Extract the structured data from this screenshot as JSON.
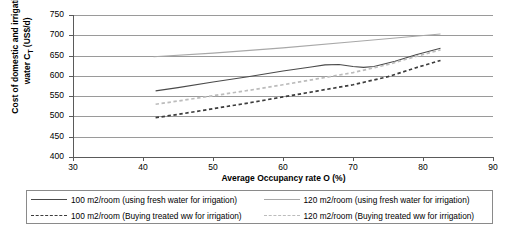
{
  "chart_data": {
    "type": "line",
    "title": "",
    "xlabel": "Average Occupancy rate O (%)",
    "ylabel_line1": "Cost of domestic and irrigation",
    "ylabel_line2": "water C",
    "ylabel_sub": "T",
    "ylabel_line2b": " (US$/d)",
    "xlim": [
      30,
      90
    ],
    "ylim": [
      400,
      750
    ],
    "xticks": [
      "30",
      "40",
      "50",
      "60",
      "70",
      "80",
      "90"
    ],
    "yticks": [
      "400",
      "450",
      "500",
      "550",
      "600",
      "650",
      "700",
      "750"
    ],
    "grid": true,
    "legend_position": "bottom",
    "series": [
      {
        "name": "100 m2/room (using fresh water for irrigation)",
        "style": "solid",
        "color": "#4a4a4a",
        "x": [
          41.8,
          45,
          50,
          55,
          60,
          64,
          66,
          68,
          70,
          71.5,
          73,
          76,
          79,
          82.5
        ],
        "y": [
          563,
          571,
          585,
          598,
          612,
          622,
          627,
          628,
          623,
          621,
          623,
          636,
          652,
          668
        ]
      },
      {
        "name": "120 m2/room (using fresh water for irrigation)",
        "style": "solid",
        "color": "#a8a8a8",
        "x": [
          41.5,
          50,
          60,
          70,
          82.5
        ],
        "y": [
          647,
          656,
          669,
          684,
          703
        ]
      },
      {
        "name": "100 m2/room (Buying treated ww for irrigation)",
        "style": "dashed",
        "color": "#3c3c3c",
        "x": [
          41.8,
          45,
          50,
          55,
          60,
          65,
          70,
          75,
          79,
          82.5
        ],
        "y": [
          497,
          505,
          519,
          533,
          548,
          563,
          578,
          598,
          620,
          638
        ]
      },
      {
        "name": "120 m2/room (Buying treated ww for irrigation)",
        "style": "dashed",
        "color": "#bcbcbc",
        "x": [
          41.8,
          45,
          50,
          55,
          60,
          65,
          70,
          75,
          79,
          82.5
        ],
        "y": [
          530,
          538,
          551,
          564,
          578,
          593,
          608,
          628,
          648,
          664
        ]
      }
    ]
  },
  "legend": {
    "items": [
      "100 m2/room (using fresh water for irrigation)",
      "120 m2/room (using fresh water for irrigation)",
      "100 m2/room (Buying treated ww for irrigation)",
      "120 m2/room (Buying treated ww for irrigation)"
    ]
  }
}
